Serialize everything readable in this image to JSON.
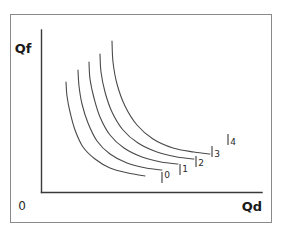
{
  "figure": {
    "border_color": "#8a8a8a",
    "background_color": "#ffffff",
    "axis_color": "#3a3a3a",
    "curve_color": "#4a4a4a",
    "text_color": "#1a1a1a"
  },
  "axes": {
    "y_label": "Qf",
    "x_label": "Qd",
    "origin_label": "0"
  },
  "chart_data": {
    "type": "line",
    "title": "",
    "subtitle": "",
    "xlabel": "Qd",
    "ylabel": "Qf",
    "grid": false,
    "legend": "inline-end-of-curve",
    "xlim": [
      0,
      10
    ],
    "ylim": [
      0,
      10
    ],
    "annotations": [
      "0"
    ],
    "series": [
      {
        "name": "0",
        "label": "0",
        "tick_mark": "|",
        "points_px": [
          [
            66,
            82
          ],
          [
            67,
            96
          ],
          [
            70,
            112
          ],
          [
            75,
            130
          ],
          [
            83,
            147
          ],
          [
            95,
            159
          ],
          [
            110,
            168
          ],
          [
            128,
            173
          ],
          [
            145,
            176
          ]
        ],
        "label_px": [
          167,
          178
        ],
        "tick_px": [
          162,
          172
        ]
      },
      {
        "name": "1",
        "label": "1",
        "tick_mark": "|",
        "points_px": [
          [
            78,
            70
          ],
          [
            79,
            86
          ],
          [
            82,
            104
          ],
          [
            88,
            123
          ],
          [
            97,
            141
          ],
          [
            110,
            154
          ],
          [
            127,
            163
          ],
          [
            146,
            168
          ],
          [
            162,
            170
          ]
        ],
        "label_px": [
          185,
          172
        ],
        "tick_px": [
          180,
          164
        ]
      },
      {
        "name": "2",
        "label": "2",
        "tick_mark": "|",
        "points_px": [
          [
            89,
            62
          ],
          [
            90,
            79
          ],
          [
            94,
            98
          ],
          [
            100,
            117
          ],
          [
            110,
            135
          ],
          [
            124,
            148
          ],
          [
            142,
            157
          ],
          [
            161,
            162
          ],
          [
            178,
            164
          ]
        ],
        "label_px": [
          201,
          166
        ],
        "tick_px": [
          196,
          156
        ]
      },
      {
        "name": "3",
        "label": "3",
        "tick_mark": "|",
        "points_px": [
          [
            100,
            54
          ],
          [
            101,
            72
          ],
          [
            105,
            92
          ],
          [
            112,
            112
          ],
          [
            123,
            130
          ],
          [
            138,
            143
          ],
          [
            157,
            152
          ],
          [
            177,
            157
          ],
          [
            194,
            159
          ]
        ],
        "label_px": [
          217,
          157
        ],
        "tick_px": [
          212,
          146
        ]
      },
      {
        "name": "4",
        "label": "4",
        "tick_mark": "|",
        "points_px": [
          [
            112,
            41
          ],
          [
            113,
            62
          ],
          [
            117,
            84
          ],
          [
            125,
            106
          ],
          [
            137,
            125
          ],
          [
            153,
            139
          ],
          [
            173,
            148
          ],
          [
            194,
            152
          ],
          [
            210,
            154
          ]
        ],
        "label_px": [
          233,
          145
        ],
        "tick_px": [
          228,
          134
        ]
      }
    ]
  }
}
